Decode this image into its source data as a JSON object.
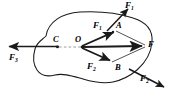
{
  "figure": {
    "type": "free-body-diagram",
    "colors": {
      "stroke": "#1a1a1a",
      "dashed": "#8a8a8a",
      "background": "#ffffff"
    },
    "labels": {
      "f1_inner": "F",
      "f1_inner_sub": "1",
      "f2_inner": "F",
      "f2_inner_sub": "2",
      "f1_outer": "F",
      "f1_outer_sub": "1",
      "f2_outer": "F",
      "f2_outer_sub": "2",
      "f3": "F",
      "f3_sub": "3",
      "resultant": "F",
      "point_o": "O",
      "point_a": "A",
      "point_b": "B",
      "point_c": "C"
    },
    "geometry": {
      "O": [
        82,
        47
      ],
      "A": [
        116,
        31
      ],
      "B": [
        112,
        62
      ],
      "F": [
        146,
        46
      ],
      "C": [
        57,
        47
      ],
      "F3_tip": [
        6,
        46
      ],
      "F1_outer_tip": [
        130,
        7
      ],
      "F2_outer_tip": [
        166,
        88
      ]
    }
  }
}
